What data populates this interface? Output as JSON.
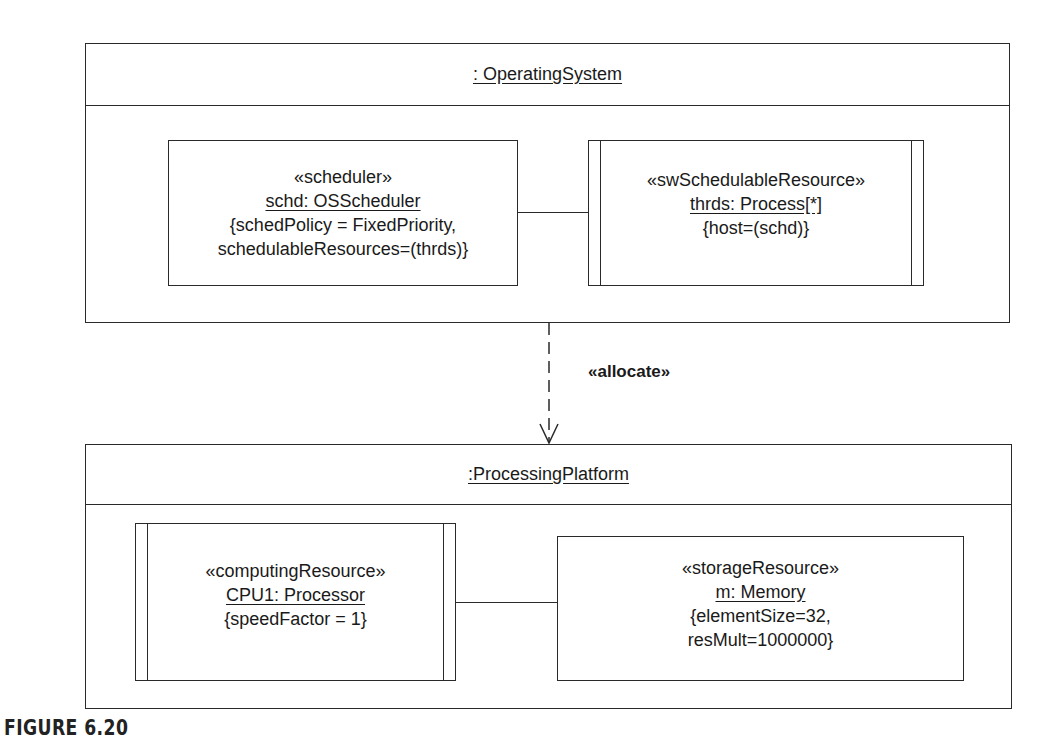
{
  "diagram": {
    "top_frame": {
      "title": ": OperatingSystem",
      "parts": [
        {
          "stereotype": "«scheduler»",
          "name": "schd: OSScheduler",
          "constraints": [
            "{schedPolicy = FixedPriority,",
            "schedulableResources=(thrds)}"
          ],
          "active": false
        },
        {
          "stereotype": "«swSchedulableResource»",
          "name": "thrds: Process[*]",
          "constraints": [
            "{host=(schd)}"
          ],
          "active": true
        }
      ]
    },
    "dependency": {
      "label": "«allocate»",
      "style": "dashed",
      "from": ": OperatingSystem",
      "to": ":ProcessingPlatform"
    },
    "bottom_frame": {
      "title": ":ProcessingPlatform",
      "parts": [
        {
          "stereotype": "«computingResource»",
          "name": "CPU1: Processor",
          "constraints": [
            "{speedFactor = 1}"
          ],
          "active": true
        },
        {
          "stereotype": "«storageResource»",
          "name": "m: Memory",
          "constraints": [
            "{elementSize=32,",
            "resMult=1000000}"
          ],
          "active": false
        }
      ]
    },
    "caption": "FIGURE 6.20"
  }
}
